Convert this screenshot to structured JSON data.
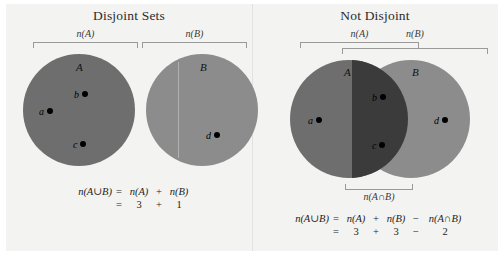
{
  "figure": {
    "background_color": "#f3f3f1",
    "panels": [
      {
        "id": "disjoint",
        "title": "Disjoint Sets",
        "brackets": [
          {
            "name": "n(A)",
            "label": "n(A)"
          },
          {
            "name": "n(B)",
            "label": "n(B)"
          }
        ],
        "sets": [
          {
            "name": "A",
            "label": "A",
            "color": "#6e6e6e",
            "elements": [
              {
                "label": "a"
              },
              {
                "label": "b"
              },
              {
                "label": "c"
              }
            ]
          },
          {
            "name": "B",
            "label": "B",
            "color": "#8c8c8c",
            "elements": [
              {
                "label": "d"
              }
            ]
          }
        ],
        "equation": {
          "line1": {
            "lhs": "n(A∪B)",
            "eq": "=",
            "term1": "n(A)",
            "op1": "+",
            "term2": "n(B)"
          },
          "line2": {
            "eq": "=",
            "term1": "3",
            "op1": "+",
            "term2": "1"
          }
        }
      },
      {
        "id": "not-disjoint",
        "title": "Not Disjoint",
        "brackets": [
          {
            "name": "n(A)",
            "label": "n(A)"
          },
          {
            "name": "n(B)",
            "label": "n(B)"
          },
          {
            "name": "n(A∩B)",
            "label": "n(A∩B)"
          }
        ],
        "sets": [
          {
            "name": "A",
            "label": "A",
            "color": "#6e6e6e",
            "elements": [
              {
                "label": "a"
              }
            ]
          },
          {
            "name": "B",
            "label": "B",
            "color": "#8c8c8c",
            "elements": [
              {
                "label": "d"
              }
            ]
          },
          {
            "name": "A-intersect-B",
            "label": "",
            "color": "#3b3b3b",
            "elements": [
              {
                "label": "b"
              },
              {
                "label": "c"
              }
            ]
          }
        ],
        "equation": {
          "line1": {
            "lhs": "n(A∪B)",
            "eq": "=",
            "term1": "n(A)",
            "op1": "+",
            "term2": "n(B)",
            "op2": "−",
            "term3": "n(A∩B)"
          },
          "line2": {
            "eq": "=",
            "term1": "3",
            "op1": "+",
            "term2": "3",
            "op2": "−",
            "term3": "2"
          }
        }
      }
    ]
  }
}
